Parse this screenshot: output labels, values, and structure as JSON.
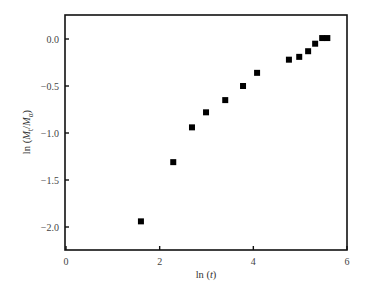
{
  "chart_data": {
    "type": "scatter",
    "title": "",
    "xlabel": "ln (t)",
    "ylabel": "ln (M_t/M_α)",
    "xlabel_parts": {
      "prefix": "ln (",
      "var": "t",
      "suffix": ")"
    },
    "ylabel_parts": {
      "prefix": "ln (",
      "var1": "M",
      "sub1": "t",
      "slash": "/",
      "var2": "M",
      "sub2": "α",
      "suffix": ")"
    },
    "xlim": [
      0,
      6
    ],
    "ylim": [
      -2.25,
      0.25
    ],
    "xticks": [
      0,
      2,
      4,
      6
    ],
    "xtick_labels": [
      "0",
      "2",
      "4",
      "6"
    ],
    "yticks": [
      0.0,
      -0.5,
      -1.0,
      -1.5,
      -2.0
    ],
    "ytick_labels": [
      "0.0",
      "−0.5",
      "−1.0",
      "−1.5",
      "−2.0"
    ],
    "grid": false,
    "legend": null,
    "marker": "square",
    "marker_color": "#000000",
    "series": [
      {
        "name": "data",
        "x": [
          1.6,
          2.29,
          2.69,
          2.99,
          3.4,
          3.78,
          4.08,
          4.76,
          4.98,
          5.17,
          5.32,
          5.47,
          5.58
        ],
        "y": [
          -1.94,
          -1.31,
          -0.94,
          -0.78,
          -0.65,
          -0.5,
          -0.36,
          -0.22,
          -0.19,
          -0.13,
          -0.05,
          0.01,
          0.01
        ]
      }
    ]
  }
}
